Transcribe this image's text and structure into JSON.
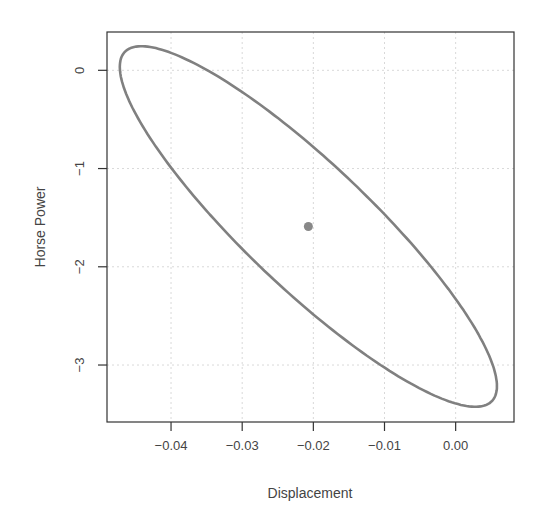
{
  "chart_data": {
    "type": "scatter",
    "title": "",
    "xlabel": "Displacement",
    "ylabel": "Horse Power",
    "xlim": [
      -0.049,
      0.0082
    ],
    "ylim": [
      -3.58,
      0.39
    ],
    "xticks": [
      -0.04,
      -0.03,
      -0.02,
      -0.01,
      0.0
    ],
    "xtick_labels": [
      "−0.04",
      "−0.03",
      "−0.02",
      "−0.01",
      "0.00"
    ],
    "yticks": [
      0,
      -1,
      -2,
      -3
    ],
    "ytick_labels": [
      "0",
      "−1",
      "−2",
      "−3"
    ],
    "grid": true,
    "legend": null,
    "series": [
      {
        "name": "confidence ellipse",
        "kind": "ellipse",
        "center": [
          -0.0207,
          -1.59
        ],
        "x_extent": [
          -0.0469,
          0.0061
        ],
        "y_extent": [
          -3.43,
          0.24
        ],
        "leftmost_point": [
          -0.0469,
          0.03
        ],
        "rightmost_point": [
          0.006,
          -3.22
        ],
        "top_point": [
          -0.0443,
          0.24
        ],
        "bottom_point": [
          0.0031,
          -3.46
        ],
        "color": "#808080"
      },
      {
        "name": "point estimate",
        "kind": "point",
        "x": [
          -0.0207
        ],
        "y": [
          -1.59
        ],
        "color": "#808080"
      }
    ]
  }
}
